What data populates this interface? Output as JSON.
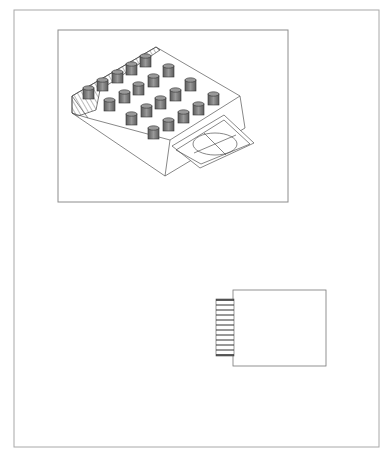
{
  "drawing": {
    "type": "technical-drawing",
    "line_color": "#9a9a9a",
    "ink_color": "#333333",
    "cylinder_fill": "#8a8a8a",
    "outer_border": {
      "x": 14,
      "y": 10,
      "w": 365,
      "h": 437
    },
    "iso_frame": {
      "x": 58,
      "y": 30,
      "w": 230,
      "h": 172
    },
    "iso_view": {
      "description": "Isometric view of block with cylindrical pins and flanged tab",
      "pin_rows": [
        {
          "row": 1,
          "count": 6
        },
        {
          "row": 2,
          "count": 5
        },
        {
          "row": 3,
          "count": 5
        },
        {
          "row": 4,
          "count": 4
        }
      ],
      "tab": {
        "feature": "circle with crosshair"
      }
    },
    "plan_view": {
      "description": "Plan view: rectangle with hatched connector strip on left",
      "rect": {
        "x": 233,
        "y": 290,
        "w": 93,
        "h": 76
      },
      "hatch": {
        "x": 216,
        "y": 299,
        "w": 18,
        "h": 57,
        "lines": 12
      }
    }
  }
}
